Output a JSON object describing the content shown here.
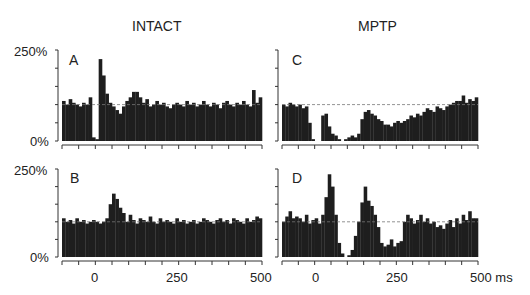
{
  "chart_data": [
    {
      "type": "bar",
      "panel": "A",
      "group": "INTACT",
      "title": "INTACT",
      "xlabel": "ms",
      "ylabel": "",
      "ylim": [
        0,
        250
      ],
      "xlim": [
        -100,
        500
      ],
      "yticks": [
        "0%",
        "250%"
      ],
      "xticks": [],
      "baseline_percent": 100,
      "bin_ms": 10,
      "x": [
        -100,
        -90,
        -80,
        -70,
        -60,
        -50,
        -40,
        -30,
        -20,
        -10,
        0,
        10,
        20,
        30,
        40,
        50,
        60,
        70,
        80,
        90,
        100,
        110,
        120,
        130,
        140,
        150,
        160,
        170,
        180,
        190,
        200,
        210,
        220,
        230,
        240,
        250,
        260,
        270,
        280,
        290,
        300,
        310,
        320,
        330,
        340,
        350,
        360,
        370,
        380,
        390,
        400,
        410,
        420,
        430,
        440,
        450,
        460,
        470,
        480,
        490
      ],
      "values": [
        110,
        100,
        115,
        105,
        100,
        95,
        105,
        100,
        120,
        10,
        5,
        225,
        180,
        130,
        105,
        95,
        85,
        75,
        95,
        110,
        120,
        135,
        135,
        120,
        105,
        115,
        95,
        100,
        110,
        100,
        105,
        95,
        90,
        100,
        105,
        100,
        95,
        110,
        100,
        105,
        95,
        100,
        110,
        100,
        95,
        105,
        100,
        90,
        105,
        110,
        100,
        95,
        105,
        100,
        110,
        100,
        95,
        140,
        105,
        120
      ]
    },
    {
      "type": "bar",
      "panel": "B",
      "group": "INTACT",
      "xlabel": "ms",
      "ylim": [
        0,
        250
      ],
      "xlim": [
        -100,
        500
      ],
      "yticks": [
        "0%",
        "250%"
      ],
      "xticks": [
        "0",
        "250",
        "500"
      ],
      "baseline_percent": 100,
      "bin_ms": 10,
      "x": [
        -100,
        -90,
        -80,
        -70,
        -60,
        -50,
        -40,
        -30,
        -20,
        -10,
        0,
        10,
        20,
        30,
        40,
        50,
        60,
        70,
        80,
        90,
        100,
        110,
        120,
        130,
        140,
        150,
        160,
        170,
        180,
        190,
        200,
        210,
        220,
        230,
        240,
        250,
        260,
        270,
        280,
        290,
        300,
        310,
        320,
        330,
        340,
        350,
        360,
        370,
        380,
        390,
        400,
        410,
        420,
        430,
        440,
        450,
        460,
        470,
        480,
        490
      ],
      "values": [
        110,
        100,
        105,
        95,
        110,
        100,
        105,
        95,
        100,
        105,
        100,
        95,
        100,
        110,
        150,
        180,
        165,
        140,
        125,
        100,
        120,
        105,
        95,
        110,
        105,
        100,
        115,
        100,
        95,
        110,
        100,
        105,
        100,
        95,
        110,
        100,
        105,
        95,
        100,
        105,
        95,
        100,
        110,
        105,
        100,
        95,
        105,
        110,
        100,
        105,
        95,
        110,
        105,
        100,
        95,
        110,
        100,
        105,
        115,
        110
      ]
    },
    {
      "type": "bar",
      "panel": "C",
      "group": "MPTP",
      "title": "MPTP",
      "xlabel": "ms",
      "ylim": [
        0,
        250
      ],
      "xlim": [
        -100,
        500
      ],
      "yticks": [],
      "xticks": [],
      "baseline_percent": 100,
      "bin_ms": 10,
      "x": [
        -100,
        -90,
        -80,
        -70,
        -60,
        -50,
        -40,
        -30,
        -20,
        -10,
        0,
        10,
        20,
        30,
        40,
        50,
        60,
        70,
        80,
        90,
        100,
        110,
        120,
        130,
        140,
        150,
        160,
        170,
        180,
        190,
        200,
        210,
        220,
        230,
        240,
        250,
        260,
        270,
        280,
        290,
        300,
        310,
        320,
        330,
        340,
        350,
        360,
        370,
        380,
        390,
        400,
        410,
        420,
        430,
        440,
        450,
        460,
        470,
        480,
        490
      ],
      "values": [
        100,
        95,
        105,
        100,
        95,
        100,
        90,
        95,
        50,
        5,
        0,
        0,
        70,
        75,
        40,
        20,
        15,
        5,
        0,
        5,
        10,
        15,
        10,
        20,
        60,
        80,
        85,
        75,
        70,
        60,
        55,
        45,
        45,
        40,
        50,
        55,
        50,
        55,
        60,
        70,
        65,
        75,
        70,
        80,
        90,
        85,
        80,
        95,
        90,
        85,
        95,
        100,
        105,
        110,
        110,
        125,
        105,
        115,
        110,
        120
      ]
    },
    {
      "type": "bar",
      "panel": "D",
      "group": "MPTP",
      "xlabel": "ms",
      "ylim": [
        0,
        250
      ],
      "xlim": [
        -100,
        500
      ],
      "yticks": [
        "0%",
        "250%"
      ],
      "xticks": [
        "0",
        "250",
        "500 ms"
      ],
      "baseline_percent": 100,
      "bin_ms": 10,
      "x": [
        -100,
        -90,
        -80,
        -70,
        -60,
        -50,
        -40,
        -30,
        -20,
        -10,
        0,
        10,
        20,
        30,
        40,
        50,
        60,
        70,
        80,
        90,
        100,
        110,
        120,
        130,
        140,
        150,
        160,
        170,
        180,
        190,
        200,
        210,
        220,
        230,
        240,
        250,
        260,
        270,
        280,
        290,
        300,
        310,
        320,
        330,
        340,
        350,
        360,
        370,
        380,
        390,
        400,
        410,
        420,
        430,
        440,
        450,
        460,
        470,
        480,
        490
      ],
      "values": [
        100,
        115,
        130,
        110,
        115,
        110,
        100,
        120,
        95,
        105,
        110,
        95,
        120,
        170,
        235,
        200,
        120,
        40,
        10,
        0,
        5,
        20,
        60,
        100,
        155,
        200,
        160,
        145,
        120,
        85,
        40,
        30,
        35,
        50,
        30,
        40,
        45,
        100,
        120,
        110,
        95,
        105,
        120,
        100,
        110,
        95,
        100,
        85,
        90,
        80,
        95,
        105,
        85,
        110,
        95,
        120,
        105,
        130,
        110,
        110
      ]
    }
  ],
  "figure": {
    "column_titles": [
      "INTACT",
      "MPTP"
    ],
    "panel_labels": [
      "A",
      "B",
      "C",
      "D"
    ],
    "ytick_top": "250%",
    "ytick_bottom": "0%",
    "xtick_labels": [
      "0",
      "250",
      "500",
      "0",
      "250",
      "500 ms"
    ]
  }
}
